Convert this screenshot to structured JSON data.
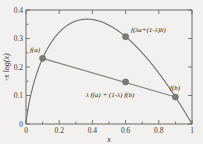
{
  "chart_data": {
    "type": "line",
    "title": "",
    "xlabel": "x",
    "ylabel": "-x log(x)",
    "xlim": [
      0,
      1
    ],
    "ylim": [
      0,
      0.4
    ],
    "grid": false,
    "legend": "none",
    "xticks": [
      "0",
      "0.2",
      "0.4",
      "0.6",
      "0.8",
      "1"
    ],
    "xtick_values": [
      0,
      0.2,
      0.4,
      0.6,
      0.8,
      1
    ],
    "yticks": [
      "0",
      "0.1",
      "0.2",
      "0.3",
      "0.4"
    ],
    "ytick_values": [
      0,
      0.1,
      0.2,
      0.3,
      0.4
    ],
    "series": [
      {
        "name": "-x log(x)",
        "kind": "curve",
        "x": [
          0.0,
          0.02,
          0.05,
          0.08,
          0.1,
          0.15,
          0.2,
          0.25,
          0.3,
          0.3679,
          0.4,
          0.45,
          0.5,
          0.55,
          0.6,
          0.65,
          0.7,
          0.75,
          0.8,
          0.85,
          0.9,
          0.95,
          1.0
        ],
        "values": [
          0.0,
          0.0782,
          0.1498,
          0.2021,
          0.2303,
          0.2846,
          0.3219,
          0.3466,
          0.3612,
          0.3679,
          0.3665,
          0.3593,
          0.3466,
          0.3288,
          0.3065,
          0.28,
          0.2497,
          0.2158,
          0.1785,
          0.1382,
          0.0948,
          0.0487,
          0.0
        ]
      },
      {
        "name": "chord",
        "kind": "line",
        "x": [
          0.1,
          0.9
        ],
        "values": [
          0.2303,
          0.0948
        ]
      }
    ],
    "points": [
      {
        "label": "f(a)",
        "x": 0.1,
        "y": 0.2303
      },
      {
        "label": "f(λa+(1-λ)b)",
        "x": 0.6,
        "y": 0.3065
      },
      {
        "label": "λ f(a) + (1-λ) f(b)",
        "x": 0.6,
        "y": 0.1475
      },
      {
        "label": "f(b)",
        "x": 0.9,
        "y": 0.0948
      }
    ],
    "annotations": [
      {
        "name": "label-fa",
        "text": "f(a)"
      },
      {
        "name": "label-f-lambda-combo",
        "text": "f(λa+(1-λ)b)"
      },
      {
        "name": "label-lambda-combo-f",
        "text": "λ f(a) + (1-λ) f(b)"
      },
      {
        "name": "label-fb",
        "text": "f(b)"
      }
    ],
    "colors": {
      "background": "#f2f1ef",
      "curve": "#6e6e6b",
      "chord": "#84847f",
      "marker": "#7a7a76",
      "axis": "#5d5d5a",
      "text": "#2b2b29"
    }
  },
  "axes": {
    "x_label": "x",
    "y_label": "-x log(x)",
    "xticks": [
      {
        "label": "0"
      },
      {
        "label": "0.2"
      },
      {
        "label": "0.4"
      },
      {
        "label": "0.6"
      },
      {
        "label": "0.8"
      },
      {
        "label": "1"
      }
    ],
    "yticks": [
      {
        "label": "0"
      },
      {
        "label": "0.1"
      },
      {
        "label": "0.2"
      },
      {
        "label": "0.3"
      },
      {
        "label": "0.4"
      }
    ]
  },
  "labels": {
    "fa": "f(a)",
    "f_of_combo": "f(λa+(1-λ)b)",
    "combo_of_f": "λ f(a) + (1-λ) f(b)",
    "fb": "f(b)"
  }
}
